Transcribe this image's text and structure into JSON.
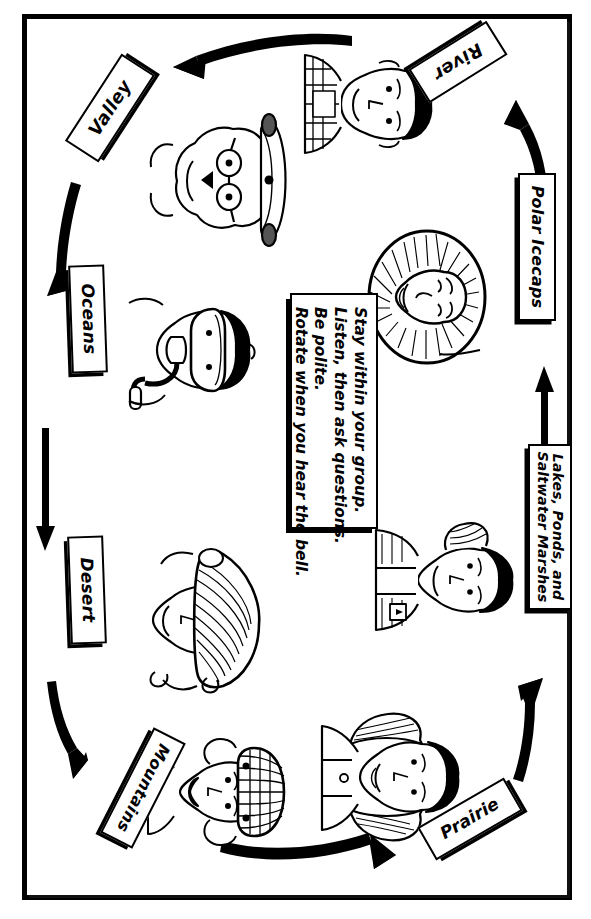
{
  "poster": {
    "title": "Biome Station Rotation Chart",
    "orientation": "rotated-90",
    "page_size": "591x919",
    "ink_color": "#000000",
    "paper_color": "#ffffff"
  },
  "instructions": {
    "name": "rules-note",
    "lines": [
      "Stay within your group.",
      "Listen, then ask questions.",
      "Be polite.",
      "Rotate when you hear the bell."
    ]
  },
  "stations": [
    {
      "id": "valley",
      "label": "Valley",
      "rotation_deg": -57,
      "figure": "person-with-glasses-and-hat"
    },
    {
      "id": "oceans",
      "label": "Oceans",
      "rotation_deg": 88,
      "figure": "scuba-diver-with-mask-and-snorkel"
    },
    {
      "id": "desert",
      "label": "Desert",
      "rotation_deg": 88,
      "figure": "person-with-wide-brim-sun-hat"
    },
    {
      "id": "mountains",
      "label": "Mountains",
      "rotation_deg": 117,
      "figure": "person-with-knit-beanie"
    },
    {
      "id": "prairie",
      "label": "Prairie",
      "rotation_deg": -30,
      "figure": "person-with-long-hair"
    },
    {
      "id": "lakes",
      "label": "Lakes, Ponds, and\nSaltwater Marshes",
      "label_line_1": "Lakes, Ponds, and",
      "label_line_2": "Saltwater Marshes",
      "rotation_deg": 90,
      "figure": "person-with-ponytail-and-vest"
    },
    {
      "id": "polar-icecaps",
      "label": "Polar Icecaps",
      "rotation_deg": 90,
      "figure": "person-in-fur-parka-hood"
    },
    {
      "id": "river",
      "label": "River",
      "rotation_deg": 148,
      "figure": "person-in-plaid-shirt"
    }
  ],
  "flow": [
    {
      "from": "river",
      "to": "valley",
      "direction": "left"
    },
    {
      "from": "valley",
      "to": "oceans",
      "direction": "down"
    },
    {
      "from": "oceans",
      "to": "desert",
      "direction": "down"
    },
    {
      "from": "desert",
      "to": "mountains",
      "direction": "down"
    },
    {
      "from": "mountains",
      "to": "prairie",
      "direction": "right"
    },
    {
      "from": "prairie",
      "to": "lakes",
      "direction": "up"
    },
    {
      "from": "lakes",
      "to": "polar-icecaps",
      "direction": "up"
    },
    {
      "from": "polar-icecaps",
      "to": "river",
      "direction": "up"
    }
  ]
}
